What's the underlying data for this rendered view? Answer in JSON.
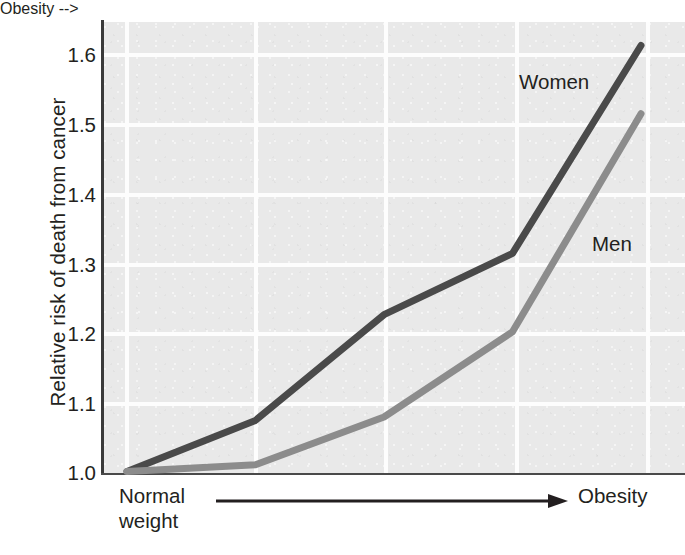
{
  "chart_data": {
    "type": "line",
    "title": "",
    "xlabel": "",
    "ylabel": "Relative risk of death from cancer",
    "x": [
      0,
      1,
      2,
      3,
      4
    ],
    "xtick_labels": [
      "",
      "",
      "",
      "",
      ""
    ],
    "x_axis_start_label": "Normal weight",
    "x_axis_end_label": "Obesity",
    "x_axis_direction": "increasing body weight",
    "ytick_labels": [
      "1.0",
      "1.1",
      "1.2",
      "1.3",
      "1.4",
      "1.5",
      "1.6"
    ],
    "ytick_values": [
      1.0,
      1.1,
      1.2,
      1.3,
      1.4,
      1.5,
      1.6
    ],
    "ylim": [
      0.99,
      1.645
    ],
    "grid": true,
    "legend_position": "inline-annotation",
    "series": [
      {
        "name": "Women",
        "color": "#4a4a4a",
        "values": [
          0.99,
          1.065,
          1.22,
          1.31,
          1.615
        ]
      },
      {
        "name": "Men",
        "color": "#8c8c8c",
        "values": [
          0.99,
          1.0,
          1.07,
          1.195,
          1.515
        ]
      }
    ]
  },
  "labels": {
    "y_axis_title": "Relative risk of death from cancer",
    "x_start_line1": "Normal",
    "x_start_line2": "weight",
    "x_end": "Obesity",
    "series_women": "Women",
    "series_men": "Men",
    "ytick_0": "1.0",
    "ytick_1": "1.1",
    "ytick_2": "1.2",
    "ytick_3": "1.3",
    "ytick_4": "1.4",
    "ytick_5": "1.5",
    "ytick_6": "1.6"
  },
  "colors": {
    "plot_background": "#e9e9e9",
    "gridline": "#fdfdfd",
    "axis": "#3a3a3a",
    "women_line": "#4a4a4a",
    "men_line": "#8c8c8c",
    "text": "#231f20",
    "page_background": "#ffffff"
  }
}
